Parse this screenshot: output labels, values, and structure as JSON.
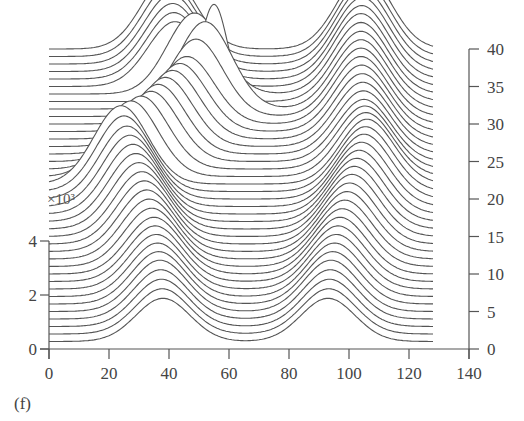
{
  "chart_data": {
    "type": "line",
    "subtype": "waterfall",
    "title": "",
    "panel_label": "(f)",
    "xlabel": "",
    "ylabel": "",
    "y_scale_note": "×10³",
    "x_ticks": [
      0,
      20,
      40,
      60,
      80,
      100,
      120,
      140
    ],
    "xlim": [
      0,
      140
    ],
    "left_y_ticks": [
      0,
      2,
      4
    ],
    "left_ylim": [
      0,
      11
    ],
    "right_y_ticks": [
      0,
      5,
      10,
      15,
      20,
      25,
      30,
      35,
      40
    ],
    "right_ylim": [
      0,
      40
    ],
    "grid": false,
    "legend": null,
    "x_extent_of_traces": [
      0,
      128
    ],
    "trace_count": 40,
    "trace_spacing_right_axis_units": 1,
    "series": [
      {
        "name": "trace 1",
        "offset": 1,
        "peak1_x": 38,
        "peak1_amp": 1.6,
        "peak2_x": 93,
        "peak2_amp": 1.6
      },
      {
        "name": "trace 5",
        "offset": 5,
        "peak1_x": 37,
        "peak1_amp": 1.9,
        "peak2_x": 94,
        "peak2_amp": 1.9
      },
      {
        "name": "trace 10",
        "offset": 10,
        "peak1_x": 35,
        "peak1_amp": 2.1,
        "peak2_x": 97,
        "peak2_amp": 2.1
      },
      {
        "name": "trace 15",
        "offset": 15,
        "peak1_x": 31,
        "peak1_amp": 2.4,
        "peak2_x": 101,
        "peak2_amp": 2.3
      },
      {
        "name": "trace 20",
        "offset": 20,
        "peak1_x": 26,
        "peak1_amp": 2.7,
        "peak2_x": 105,
        "peak2_amp": 2.4
      },
      {
        "name": "trace 22",
        "offset": 22,
        "peak1_x": 24,
        "peak1_amp": 2.9,
        "peak2_x": 106,
        "peak2_amp": 2.4
      },
      {
        "name": "trace 25",
        "offset": 25,
        "peak1_x": 34,
        "peak1_amp": 2.6,
        "peak2_x": 105,
        "peak2_amp": 2.3
      },
      {
        "name": "trace 30",
        "offset": 30,
        "peak1_x": 46,
        "peak1_amp": 2.5,
        "peak2_x": 104,
        "peak2_amp": 2.5
      },
      {
        "name": "trace 33",
        "offset": 33,
        "peak1_x": 55,
        "peak1_amp": 3.6,
        "peak2_x": 104,
        "peak2_amp": 2.6
      },
      {
        "name": "trace 35",
        "offset": 35,
        "peak1_x": 42,
        "peak1_amp": 2.4,
        "peak2_x": 104,
        "peak2_amp": 2.7
      },
      {
        "name": "trace 40",
        "offset": 40,
        "peak1_x": 40,
        "peak1_amp": 2.7,
        "peak2_x": 105,
        "peak2_amp": 2.8
      }
    ],
    "colors": {
      "line": "#555555",
      "axis": "#555555",
      "background": "#ffffff"
    }
  },
  "labels": {
    "panel": "(f)",
    "scale": "×10³"
  }
}
